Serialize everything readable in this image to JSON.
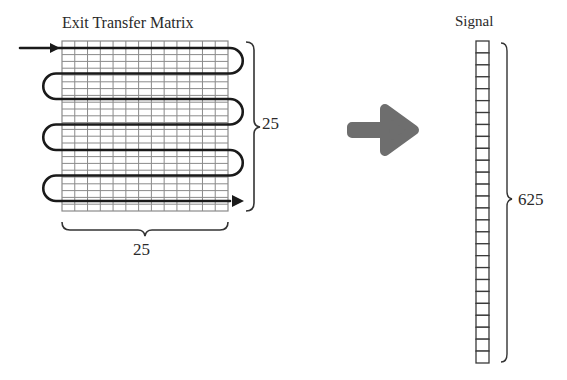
{
  "matrix": {
    "title": "Exit Transfer Matrix",
    "rows": 25,
    "cols": 25,
    "rows_label": "25",
    "cols_label": "25",
    "serpentine_passes": 7
  },
  "transform_arrow": {
    "color": "#6e6e6e"
  },
  "signal": {
    "title": "Signal",
    "length_label": "625",
    "visible_cells": 27
  },
  "colors": {
    "grid": "#8a8a8a",
    "path": "#1a1a1a",
    "cell_border": "#3a3a3a"
  }
}
